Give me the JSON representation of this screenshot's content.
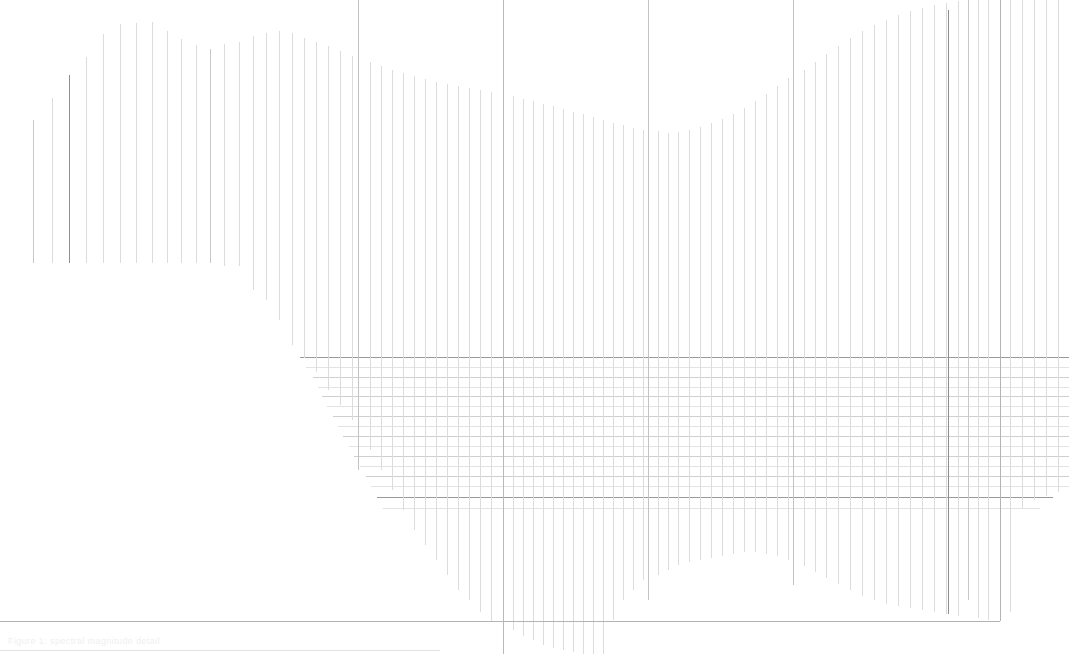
{
  "view": {
    "width": 1069,
    "height": 654,
    "background": "#ffffff",
    "description": "Extreme zoom crop of a stem / impulse spectrum plot",
    "zoom_level": "1200%"
  },
  "colors": {
    "stem_light": "#dcdcdc",
    "stem_mid": "#c9c9c9",
    "stem_dark": "#8f8f8f",
    "grid_major": "#9a9a9a",
    "grid_minor": "#cfcfcf",
    "grid_faint": "#e3e3e3",
    "axis": "#8a8a8a",
    "frame": "#b4b4b4",
    "caption_text": "#efefef"
  },
  "caption": {
    "text": "Figure 1: spectral magnitude detail",
    "x": 8,
    "y": 636
  },
  "frame": {
    "bottom_y": 621,
    "bottom_x1": 0,
    "bottom_x2": 1000,
    "right_x": 1000,
    "right_y1": 0,
    "right_y2": 621,
    "bottom2_y": 650,
    "bottom2_x1": 0,
    "bottom2_x2": 440
  },
  "axis_lines": [
    {
      "x": 1000,
      "y1": 0,
      "y2": 621,
      "color": "#9a9a9a",
      "weight": 1
    },
    {
      "x": 968,
      "y1": 0,
      "y2": 600,
      "color": "#c9c9c9",
      "weight": 1
    },
    {
      "x": 503,
      "y1": 0,
      "y2": 654,
      "color": "#b9b9b9",
      "weight": 1
    },
    {
      "x": 648,
      "y1": 0,
      "y2": 600,
      "color": "#c3c3c3",
      "weight": 1
    },
    {
      "x": 793,
      "y1": 0,
      "y2": 585,
      "color": "#c3c3c3",
      "weight": 1
    },
    {
      "x": 358,
      "y1": 0,
      "y2": 470,
      "color": "#c3c3c3",
      "weight": 1
    }
  ],
  "chart_data": {
    "type": "bar",
    "xlabel": "frequency bin",
    "ylabel": "magnitude",
    "grid": true,
    "legend": null,
    "xlim": [
      0,
      73
    ],
    "ylim": [
      0,
      1
    ],
    "note": "Values are normalised stem heights read off the envelope; the crop shows only the upper part of each stem so bottoms are clipped by the view.",
    "categories": [
      "b01",
      "b02",
      "b03",
      "b04",
      "b05",
      "b06",
      "b07",
      "b08",
      "b09",
      "b10",
      "b11",
      "b12",
      "b13",
      "b14",
      "b15",
      "b16",
      "b17",
      "b18",
      "b19",
      "b20",
      "b21",
      "b22",
      "b23",
      "b24",
      "b25",
      "b26",
      "b27",
      "b28",
      "b29",
      "b30",
      "b31",
      "b32",
      "b33",
      "b34",
      "b35",
      "b36",
      "b37",
      "b38",
      "b39",
      "b40",
      "b41",
      "b42",
      "b43",
      "b44",
      "b45",
      "b46",
      "b47",
      "b48",
      "b49",
      "b50",
      "b51",
      "b52",
      "b53",
      "b54",
      "b55",
      "b56",
      "b57",
      "b58",
      "b59",
      "b60",
      "b61",
      "b62",
      "b63",
      "b64",
      "b65",
      "b66",
      "b67",
      "b68",
      "b69",
      "b70",
      "b71",
      "b72",
      "b73"
    ],
    "values": [
      0.82,
      0.85,
      0.89,
      0.86,
      0.87,
      0.93,
      0.95,
      0.96,
      0.95,
      0.96,
      0.96,
      0.97,
      0.96,
      0.95,
      0.94,
      0.93,
      0.93,
      0.92,
      0.92,
      0.93,
      0.94,
      0.95,
      0.96,
      0.96,
      0.96,
      0.97,
      0.97,
      0.98,
      0.97,
      0.97,
      0.96,
      0.95,
      0.94,
      0.93,
      0.92,
      0.9,
      0.89,
      0.88,
      0.87,
      0.86,
      0.86,
      0.85,
      0.84,
      0.84,
      0.84,
      0.85,
      0.86,
      0.87,
      0.88,
      0.89,
      0.9,
      0.92,
      0.93,
      0.94,
      0.95,
      0.96,
      0.97,
      0.98,
      0.98,
      0.99,
      0.99,
      1.0,
      1.0,
      1.0,
      0.99,
      0.99,
      1.0,
      1.0,
      1.0,
      1.0,
      1.0,
      1.0,
      1.0
    ],
    "stems_px": [
      {
        "x": 33,
        "top": 120,
        "bottom": 263,
        "tone": "mid"
      },
      {
        "x": 52,
        "top": 98,
        "bottom": 263,
        "tone": "light"
      },
      {
        "x": 69,
        "top": 75,
        "bottom": 263,
        "tone": "dark"
      },
      {
        "x": 86,
        "top": 57,
        "bottom": 263,
        "tone": "light"
      },
      {
        "x": 103,
        "top": 34,
        "bottom": 263,
        "tone": "light"
      },
      {
        "x": 120,
        "top": 24,
        "bottom": 263,
        "tone": "light"
      },
      {
        "x": 136,
        "top": 23,
        "bottom": 263,
        "tone": "light"
      },
      {
        "x": 152,
        "top": 22,
        "bottom": 263,
        "tone": "light"
      },
      {
        "x": 167,
        "top": 31,
        "bottom": 263,
        "tone": "light"
      },
      {
        "x": 181,
        "top": 39,
        "bottom": 263,
        "tone": "light"
      },
      {
        "x": 196,
        "top": 45,
        "bottom": 263,
        "tone": "light"
      },
      {
        "x": 210,
        "top": 49,
        "bottom": 263,
        "tone": "mid"
      },
      {
        "x": 224,
        "top": 44,
        "bottom": 266,
        "tone": "light"
      },
      {
        "x": 239,
        "top": 42,
        "bottom": 266,
        "tone": "light"
      },
      {
        "x": 253,
        "top": 36,
        "bottom": 290,
        "tone": "light"
      },
      {
        "x": 266,
        "top": 33,
        "bottom": 300,
        "tone": "light"
      },
      {
        "x": 279,
        "top": 31,
        "bottom": 320,
        "tone": "light"
      },
      {
        "x": 292,
        "top": 33,
        "bottom": 345,
        "tone": "light"
      },
      {
        "x": 304,
        "top": 38,
        "bottom": 358,
        "tone": "light"
      },
      {
        "x": 316,
        "top": 42,
        "bottom": 372,
        "tone": "light"
      },
      {
        "x": 328,
        "top": 46,
        "bottom": 390,
        "tone": "light"
      },
      {
        "x": 340,
        "top": 51,
        "bottom": 405,
        "tone": "light"
      },
      {
        "x": 352,
        "top": 56,
        "bottom": 420,
        "tone": "light"
      },
      {
        "x": 358,
        "top": 68,
        "bottom": 470,
        "tone": "dark"
      },
      {
        "x": 370,
        "top": 62,
        "bottom": 450,
        "tone": "light"
      },
      {
        "x": 381,
        "top": 66,
        "bottom": 470,
        "tone": "light"
      },
      {
        "x": 392,
        "top": 70,
        "bottom": 490,
        "tone": "light"
      },
      {
        "x": 403,
        "top": 73,
        "bottom": 510,
        "tone": "light"
      },
      {
        "x": 414,
        "top": 76,
        "bottom": 530,
        "tone": "light"
      },
      {
        "x": 425,
        "top": 79,
        "bottom": 545,
        "tone": "light"
      },
      {
        "x": 436,
        "top": 82,
        "bottom": 560,
        "tone": "light"
      },
      {
        "x": 447,
        "top": 84,
        "bottom": 575,
        "tone": "light"
      },
      {
        "x": 458,
        "top": 86,
        "bottom": 590,
        "tone": "light"
      },
      {
        "x": 469,
        "top": 88,
        "bottom": 600,
        "tone": "light"
      },
      {
        "x": 480,
        "top": 90,
        "bottom": 612,
        "tone": "light"
      },
      {
        "x": 491,
        "top": 92,
        "bottom": 621,
        "tone": "light"
      },
      {
        "x": 503,
        "top": 93,
        "bottom": 654,
        "tone": "dark"
      },
      {
        "x": 513,
        "top": 96,
        "bottom": 630,
        "tone": "light"
      },
      {
        "x": 523,
        "top": 99,
        "bottom": 636,
        "tone": "light"
      },
      {
        "x": 533,
        "top": 101,
        "bottom": 640,
        "tone": "light"
      },
      {
        "x": 543,
        "top": 104,
        "bottom": 645,
        "tone": "light"
      },
      {
        "x": 553,
        "top": 106,
        "bottom": 648,
        "tone": "light"
      },
      {
        "x": 563,
        "top": 109,
        "bottom": 650,
        "tone": "light"
      },
      {
        "x": 573,
        "top": 112,
        "bottom": 652,
        "tone": "light"
      },
      {
        "x": 583,
        "top": 114,
        "bottom": 654,
        "tone": "light"
      },
      {
        "x": 593,
        "top": 117,
        "bottom": 654,
        "tone": "light"
      },
      {
        "x": 603,
        "top": 120,
        "bottom": 654,
        "tone": "light"
      },
      {
        "x": 613,
        "top": 123,
        "bottom": 620,
        "tone": "light"
      },
      {
        "x": 623,
        "top": 125,
        "bottom": 600,
        "tone": "light"
      },
      {
        "x": 633,
        "top": 128,
        "bottom": 590,
        "tone": "light"
      },
      {
        "x": 643,
        "top": 130,
        "bottom": 580,
        "tone": "light"
      },
      {
        "x": 648,
        "top": 121,
        "bottom": 600,
        "tone": "dark"
      },
      {
        "x": 658,
        "top": 131,
        "bottom": 575,
        "tone": "light"
      },
      {
        "x": 668,
        "top": 133,
        "bottom": 570,
        "tone": "light"
      },
      {
        "x": 678,
        "top": 132,
        "bottom": 565,
        "tone": "light"
      },
      {
        "x": 689,
        "top": 130,
        "bottom": 562,
        "tone": "light"
      },
      {
        "x": 700,
        "top": 127,
        "bottom": 560,
        "tone": "light"
      },
      {
        "x": 711,
        "top": 123,
        "bottom": 558,
        "tone": "light"
      },
      {
        "x": 722,
        "top": 119,
        "bottom": 556,
        "tone": "light"
      },
      {
        "x": 733,
        "top": 114,
        "bottom": 554,
        "tone": "light"
      },
      {
        "x": 744,
        "top": 108,
        "bottom": 552,
        "tone": "light"
      },
      {
        "x": 755,
        "top": 101,
        "bottom": 552,
        "tone": "light"
      },
      {
        "x": 766,
        "top": 94,
        "bottom": 554,
        "tone": "light"
      },
      {
        "x": 777,
        "top": 86,
        "bottom": 556,
        "tone": "light"
      },
      {
        "x": 788,
        "top": 78,
        "bottom": 560,
        "tone": "light"
      },
      {
        "x": 793,
        "top": 113,
        "bottom": 585,
        "tone": "dark"
      },
      {
        "x": 804,
        "top": 70,
        "bottom": 566,
        "tone": "light"
      },
      {
        "x": 815,
        "top": 62,
        "bottom": 572,
        "tone": "light"
      },
      {
        "x": 826,
        "top": 54,
        "bottom": 578,
        "tone": "light"
      },
      {
        "x": 838,
        "top": 46,
        "bottom": 584,
        "tone": "light"
      },
      {
        "x": 850,
        "top": 38,
        "bottom": 590,
        "tone": "light"
      },
      {
        "x": 862,
        "top": 31,
        "bottom": 596,
        "tone": "light"
      },
      {
        "x": 874,
        "top": 25,
        "bottom": 600,
        "tone": "light"
      },
      {
        "x": 886,
        "top": 20,
        "bottom": 604,
        "tone": "light"
      },
      {
        "x": 898,
        "top": 15,
        "bottom": 606,
        "tone": "light"
      },
      {
        "x": 910,
        "top": 11,
        "bottom": 608,
        "tone": "light"
      },
      {
        "x": 922,
        "top": 8,
        "bottom": 610,
        "tone": "light"
      },
      {
        "x": 934,
        "top": 5,
        "bottom": 612,
        "tone": "light"
      },
      {
        "x": 946,
        "top": 3,
        "bottom": 614,
        "tone": "light"
      },
      {
        "x": 948,
        "top": 10,
        "bottom": 614,
        "tone": "dark"
      },
      {
        "x": 958,
        "top": 1,
        "bottom": 616,
        "tone": "light"
      },
      {
        "x": 968,
        "top": 0,
        "bottom": 600,
        "tone": "mid"
      },
      {
        "x": 978,
        "top": 0,
        "bottom": 618,
        "tone": "light"
      },
      {
        "x": 988,
        "top": 0,
        "bottom": 620,
        "tone": "light"
      },
      {
        "x": 1000,
        "top": 0,
        "bottom": 621,
        "tone": "dark"
      },
      {
        "x": 1010,
        "top": 0,
        "bottom": 612,
        "tone": "light"
      },
      {
        "x": 1022,
        "top": 0,
        "bottom": 508,
        "tone": "light"
      },
      {
        "x": 1034,
        "top": 0,
        "bottom": 500,
        "tone": "light"
      },
      {
        "x": 1046,
        "top": 0,
        "bottom": 496,
        "tone": "light"
      },
      {
        "x": 1058,
        "top": 0,
        "bottom": 492,
        "tone": "light"
      }
    ],
    "gridlines_h_px": [
      {
        "y": 357,
        "x1": 300,
        "x2": 1069,
        "tone": "major"
      },
      {
        "y": 367,
        "x1": 306,
        "x2": 1069,
        "tone": "faint"
      },
      {
        "y": 377,
        "x1": 313,
        "x2": 1069,
        "tone": "minor"
      },
      {
        "y": 387,
        "x1": 318,
        "x2": 1069,
        "tone": "faint"
      },
      {
        "y": 396,
        "x1": 322,
        "x2": 1069,
        "tone": "minor"
      },
      {
        "y": 406,
        "x1": 327,
        "x2": 1069,
        "tone": "faint"
      },
      {
        "y": 416,
        "x1": 333,
        "x2": 1069,
        "tone": "minor"
      },
      {
        "y": 426,
        "x1": 338,
        "x2": 1069,
        "tone": "faint"
      },
      {
        "y": 436,
        "x1": 343,
        "x2": 1069,
        "tone": "minor"
      },
      {
        "y": 446,
        "x1": 349,
        "x2": 1069,
        "tone": "faint"
      },
      {
        "y": 456,
        "x1": 354,
        "x2": 1069,
        "tone": "minor"
      },
      {
        "y": 466,
        "x1": 360,
        "x2": 1069,
        "tone": "faint"
      },
      {
        "y": 476,
        "x1": 366,
        "x2": 1069,
        "tone": "minor"
      },
      {
        "y": 486,
        "x1": 371,
        "x2": 1069,
        "tone": "faint"
      },
      {
        "y": 497,
        "x1": 377,
        "x2": 1053,
        "tone": "major"
      },
      {
        "y": 508,
        "x1": 383,
        "x2": 1040,
        "tone": "faint"
      }
    ]
  }
}
